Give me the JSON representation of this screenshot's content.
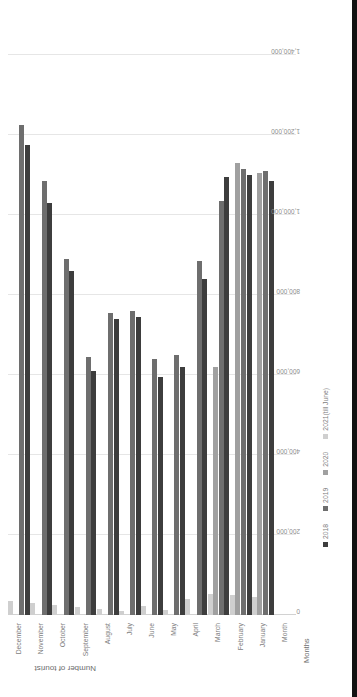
{
  "chart_data": {
    "type": "bar",
    "orientation": "horizontal",
    "title": "",
    "xlabel": "Number of tourist",
    "ylabel": "Months",
    "categories": [
      "Month",
      "January",
      "February",
      "March",
      "April",
      "May",
      "June",
      "July",
      "August",
      "September",
      "October",
      "November",
      "December"
    ],
    "tick_labels": [
      "0",
      "200,000",
      "400,000",
      "600,000",
      "800,000",
      "1,000,000",
      "1,200,000",
      "1,400,000"
    ],
    "tick_values": [
      0,
      200000,
      400000,
      600000,
      800000,
      1000000,
      1200000,
      1400000
    ],
    "xlim": [
      0,
      1400000
    ],
    "grid": true,
    "legend_position": "bottom",
    "series": [
      {
        "name": "2018",
        "color": "#3d3d3d",
        "values": [
          0,
          1085000,
          1100000,
          1095000,
          840000,
          620000,
          595000,
          745000,
          740000,
          610000,
          860000,
          1030000,
          1175000
        ]
      },
      {
        "name": "2019",
        "color": "#6e6e6e",
        "values": [
          0,
          1110000,
          1115000,
          1035000,
          885000,
          650000,
          640000,
          760000,
          755000,
          645000,
          890000,
          1085000,
          1225000
        ]
      },
      {
        "name": "2020",
        "color": "#a0a0a0",
        "values": [
          0,
          1105000,
          1130000,
          620000,
          0,
          0,
          0,
          0,
          0,
          0,
          0,
          0,
          0
        ]
      },
      {
        "name": "2021(till June)",
        "color": "#cfcfcf",
        "values": [
          0,
          45000,
          50000,
          52000,
          40000,
          12000,
          22000,
          10000,
          14000,
          20000,
          26000,
          30000,
          34000
        ]
      }
    ]
  },
  "axes": {
    "value_axis_title": "Number of tourist",
    "category_axis_title": "Months",
    "category_first_label": "Month"
  },
  "legend": {
    "items": [
      {
        "label": "2018",
        "color": "#3d3d3d"
      },
      {
        "label": "2019",
        "color": "#6e6e6e"
      },
      {
        "label": "2020",
        "color": "#a0a0a0"
      },
      {
        "label": "2021(till June)",
        "color": "#cfcfcf"
      }
    ]
  }
}
